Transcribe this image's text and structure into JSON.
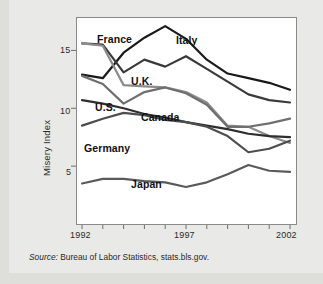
{
  "chart_data": {
    "type": "line",
    "title": "",
    "xlabel": "",
    "ylabel": "Misery Index",
    "xlim": [
      1992,
      2002
    ],
    "ylim": [
      0,
      17.8
    ],
    "yticks": [
      5,
      10,
      15
    ],
    "ytick_labels": [
      "5",
      "10",
      "15"
    ],
    "xticks": [
      1992,
      1993,
      1994,
      1995,
      1996,
      1997,
      1998,
      1999,
      2000,
      2001,
      2002
    ],
    "xtick_labels_shown": [
      "1992",
      "1997",
      "2002"
    ],
    "grid": false,
    "legend_position": "inline-labels",
    "x": [
      1992,
      1993,
      1994,
      1995,
      1996,
      1997,
      1998,
      1999,
      2000,
      2001,
      2002
    ],
    "series": [
      {
        "name": "Italy",
        "color": "#1a1a1a",
        "width": 2.2,
        "values": [
          12.9,
          12.6,
          14.8,
          16.1,
          17.1,
          16.0,
          14.2,
          13.0,
          12.6,
          12.2,
          11.6
        ]
      },
      {
        "name": "France",
        "color": "#3a3a3a",
        "width": 2.2,
        "values": [
          15.6,
          15.5,
          13.1,
          14.2,
          13.6,
          14.5,
          13.4,
          12.3,
          11.2,
          10.7,
          10.5
        ]
      },
      {
        "name": "U.K.",
        "color": "#8c8c8c",
        "width": 2.2,
        "values": [
          15.6,
          15.4,
          12.0,
          11.9,
          11.8,
          11.4,
          10.5,
          8.5,
          8.4,
          7.6,
          7.0
        ]
      },
      {
        "name": "Canada",
        "color": "#6f6f6f",
        "width": 2.2,
        "values": [
          12.8,
          12.1,
          10.4,
          11.4,
          11.8,
          11.3,
          10.3,
          8.4,
          8.4,
          8.7,
          9.1
        ]
      },
      {
        "name": "U.S.",
        "color": "#2e2e2e",
        "width": 2.2,
        "values": [
          10.7,
          10.4,
          10.0,
          9.5,
          9.2,
          8.8,
          8.5,
          8.2,
          7.8,
          7.6,
          7.5
        ]
      },
      {
        "name": "Germany",
        "color": "#4d4d4d",
        "width": 2.2,
        "values": [
          8.5,
          9.1,
          9.6,
          9.4,
          9.0,
          8.8,
          8.4,
          7.6,
          6.2,
          6.5,
          7.2
        ]
      },
      {
        "name": "Japan",
        "color": "#5a5a5a",
        "width": 2.2,
        "values": [
          3.5,
          3.9,
          3.9,
          3.7,
          3.6,
          3.2,
          3.6,
          4.3,
          5.1,
          4.6,
          4.5
        ]
      }
    ],
    "annotations": [
      {
        "text": "France",
        "x_px": 97,
        "y_px": 33
      },
      {
        "text": "Italy",
        "x_px": 176,
        "y_px": 34
      },
      {
        "text": "U.K.",
        "x_px": 131,
        "y_px": 75
      },
      {
        "text": "Canada",
        "x_px": 141,
        "y_px": 111
      },
      {
        "text": "U.S.",
        "x_px": 95,
        "y_px": 101
      },
      {
        "text": "Germany",
        "x_px": 84,
        "y_px": 142
      },
      {
        "text": "Japan",
        "x_px": 131,
        "y_px": 178
      }
    ]
  },
  "source": {
    "label": "Source:",
    "text": "Bureau of Labor Statistics, stats.bls.gov."
  }
}
